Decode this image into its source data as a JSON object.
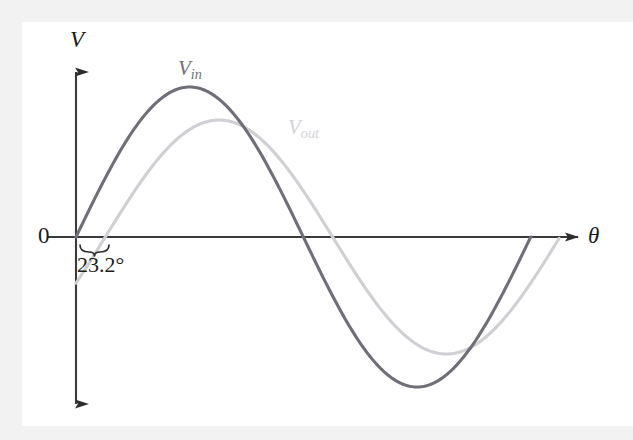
{
  "figure": {
    "background_color": "#f2f2f2",
    "canvas_color": "#ffffff",
    "axis_color": "#3a3a3a"
  },
  "labels": {
    "v_axis": "V",
    "theta_axis": "θ",
    "origin": "0",
    "vin_base": "V",
    "vin_sub": "in",
    "vout_base": "V",
    "vout_sub": "out",
    "phase_shift": "23.2°"
  },
  "chart_data": {
    "type": "line",
    "title": "",
    "xlabel": "θ",
    "ylabel": "V",
    "grid": false,
    "legend_position": "inline-annotation",
    "axis_origin_label": "0",
    "annotations": [
      {
        "name": "phase-shift-brace",
        "text": "23.2°",
        "describes": "phase lag between V_in and V_out zero crossings"
      }
    ],
    "x": [
      0,
      15,
      30,
      45,
      60,
      75,
      90,
      105,
      120,
      135,
      150,
      165,
      180,
      195,
      210,
      225,
      240,
      255,
      270,
      285,
      300,
      315,
      330,
      345,
      360,
      375,
      383.2
    ],
    "series": [
      {
        "name": "V_in",
        "label": "V_in",
        "color": "#6f6f78",
        "amplitude": 1.0,
        "phase_deg": 0,
        "values": [
          0,
          0.259,
          0.5,
          0.707,
          0.866,
          0.966,
          1.0,
          0.966,
          0.866,
          0.707,
          0.5,
          0.259,
          0,
          -0.259,
          -0.5,
          -0.707,
          -0.866,
          -0.966,
          -1.0,
          -0.966,
          -0.866,
          -0.707,
          -0.5,
          -0.259,
          0,
          0,
          0
        ]
      },
      {
        "name": "V_out",
        "label": "V_out",
        "color": "#cfcfd4",
        "amplitude": 0.78,
        "phase_deg": -23.2,
        "values": [
          -0.307,
          -0.063,
          0.184,
          0.41,
          0.6,
          0.733,
          0.78,
          0.776,
          0.714,
          0.597,
          0.434,
          0.235,
          0.02,
          -0.199,
          -0.407,
          -0.58,
          -0.711,
          -0.773,
          -0.776,
          -0.717,
          -0.6,
          -0.437,
          -0.238,
          -0.02,
          0.197,
          0.408,
          0.475
        ]
      }
    ],
    "xlim": [
      0,
      383.2
    ],
    "ylim": [
      -1.15,
      1.15
    ]
  }
}
